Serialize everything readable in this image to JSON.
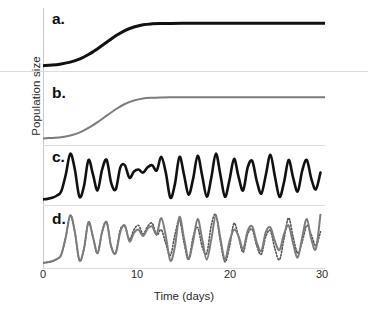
{
  "figure": {
    "axis_labels": {
      "y": "Population size",
      "x": "Time (days)"
    },
    "panel_labels": {
      "a": "a.",
      "b": "b.",
      "c": "c.",
      "d": "d."
    },
    "xticks": [
      "0",
      "10",
      "20",
      "30"
    ],
    "colors": {
      "black_curve": "#111111",
      "gray_curve": "#7c7c7c",
      "dotted_curve": "#555555",
      "axis": "#c9c9c9",
      "separator": "#dcdcdc",
      "background": "#ffffff"
    }
  },
  "chart_data": [
    {
      "type": "line",
      "panel": "a.",
      "title": "",
      "xlabel": "Time (days)",
      "ylabel": "Population size",
      "xlim": [
        0,
        31
      ],
      "ylim": [
        0,
        1
      ],
      "grid": false,
      "legend": "none",
      "series": [
        {
          "name": "stable equilibrium (thick black)",
          "style": "solid",
          "color": "#111111",
          "linewidth": 3,
          "x": [
            0,
            1,
            2,
            3,
            4,
            5,
            6,
            7,
            8,
            9,
            10,
            11,
            12,
            13,
            14,
            16,
            18,
            20,
            22,
            24,
            26,
            28,
            30,
            31
          ],
          "values": [
            0.04,
            0.05,
            0.07,
            0.1,
            0.15,
            0.23,
            0.33,
            0.44,
            0.55,
            0.64,
            0.7,
            0.74,
            0.755,
            0.76,
            0.762,
            0.763,
            0.763,
            0.763,
            0.763,
            0.763,
            0.763,
            0.763,
            0.763,
            0.763
          ]
        }
      ]
    },
    {
      "type": "line",
      "panel": "b.",
      "title": "",
      "xlabel": "Time (days)",
      "ylabel": "Population size",
      "xlim": [
        0,
        31
      ],
      "ylim": [
        0,
        1
      ],
      "grid": false,
      "legend": "none",
      "series": [
        {
          "name": "stable equilibrium (gray)",
          "style": "solid",
          "color": "#7c7c7c",
          "linewidth": 2,
          "x": [
            0,
            1,
            2,
            3,
            4,
            5,
            6,
            7,
            8,
            9,
            10,
            11,
            12,
            13,
            14,
            16,
            18,
            20,
            22,
            24,
            26,
            28,
            30,
            31
          ],
          "values": [
            0.06,
            0.07,
            0.08,
            0.11,
            0.16,
            0.24,
            0.34,
            0.45,
            0.56,
            0.65,
            0.71,
            0.745,
            0.757,
            0.762,
            0.764,
            0.765,
            0.765,
            0.765,
            0.765,
            0.765,
            0.765,
            0.765,
            0.765,
            0.765
          ]
        }
      ]
    },
    {
      "type": "line",
      "panel": "c.",
      "title": "",
      "xlabel": "Time (days)",
      "ylabel": "Population size",
      "xlim": [
        0,
        31
      ],
      "ylim": [
        0,
        1
      ],
      "grid": false,
      "legend": "none",
      "series": [
        {
          "name": "chaotic oscillation (thick black)",
          "style": "solid",
          "color": "#111111",
          "linewidth": 2.6,
          "x": [
            0,
            0.5,
            1,
            1.5,
            2,
            2.5,
            3,
            3.5,
            4,
            4.5,
            5,
            5.5,
            6,
            6.5,
            7,
            7.5,
            8,
            8.5,
            9,
            9.5,
            10,
            10.5,
            11,
            11.5,
            12,
            12.5,
            13,
            13.5,
            14,
            14.5,
            15,
            15.5,
            16,
            16.5,
            17,
            17.5,
            18,
            18.5,
            19,
            19.5,
            20,
            20.5,
            21,
            21.5,
            22,
            22.5,
            23,
            23.5,
            24,
            24.5,
            25,
            25.5,
            26,
            26.5,
            27,
            27.5,
            28,
            28.5,
            29,
            29.5,
            30,
            30.5
          ],
          "values": [
            0.05,
            0.06,
            0.08,
            0.12,
            0.2,
            0.52,
            0.92,
            0.62,
            0.1,
            0.3,
            0.8,
            0.52,
            0.22,
            0.62,
            0.8,
            0.36,
            0.24,
            0.66,
            0.7,
            0.46,
            0.58,
            0.62,
            0.56,
            0.66,
            0.7,
            0.6,
            0.86,
            0.56,
            0.08,
            0.34,
            0.86,
            0.52,
            0.14,
            0.44,
            0.88,
            0.5,
            0.1,
            0.46,
            0.92,
            0.52,
            0.1,
            0.42,
            0.82,
            0.48,
            0.22,
            0.66,
            0.78,
            0.4,
            0.16,
            0.52,
            0.9,
            0.48,
            0.1,
            0.38,
            0.8,
            0.46,
            0.2,
            0.6,
            0.8,
            0.44,
            0.24,
            0.56
          ]
        }
      ]
    },
    {
      "type": "line",
      "panel": "d.",
      "title": "",
      "xlabel": "Time (days)",
      "ylabel": "Population size",
      "xlim": [
        0,
        31
      ],
      "ylim": [
        0,
        1
      ],
      "grid": false,
      "legend": "none",
      "series": [
        {
          "name": "trajectory 1 (gray solid)",
          "style": "solid",
          "color": "#7c7c7c",
          "linewidth": 2,
          "x": [
            0,
            0.5,
            1,
            1.5,
            2,
            2.5,
            3,
            3.5,
            4,
            4.5,
            5,
            5.5,
            6,
            6.5,
            7,
            7.5,
            8,
            8.5,
            9,
            9.5,
            10,
            10.5,
            11,
            11.5,
            12,
            12.5,
            13,
            13.5,
            14,
            14.5,
            15,
            15.5,
            16,
            16.5,
            17,
            17.5,
            18,
            18.5,
            19,
            19.5,
            20,
            20.5,
            21,
            21.5,
            22,
            22.5,
            23,
            23.5,
            24,
            24.5,
            25,
            25.5,
            26,
            26.5,
            27,
            27.5,
            28,
            28.5,
            29,
            29.5,
            30,
            30.5
          ],
          "values": [
            0.04,
            0.05,
            0.07,
            0.11,
            0.19,
            0.52,
            0.93,
            0.62,
            0.09,
            0.3,
            0.8,
            0.52,
            0.22,
            0.62,
            0.8,
            0.34,
            0.22,
            0.62,
            0.74,
            0.44,
            0.6,
            0.66,
            0.54,
            0.68,
            0.72,
            0.58,
            0.88,
            0.54,
            0.08,
            0.34,
            0.9,
            0.5,
            0.12,
            0.44,
            0.86,
            0.48,
            0.1,
            0.48,
            0.92,
            0.5,
            0.1,
            0.44,
            0.66,
            0.54,
            0.3,
            0.64,
            0.72,
            0.42,
            0.26,
            0.62,
            0.7,
            0.44,
            0.28,
            0.58,
            0.74,
            0.4,
            0.14,
            0.52,
            0.86,
            0.48,
            0.3,
            0.94
          ]
        },
        {
          "name": "trajectory 2 (dotted)",
          "style": "dotted",
          "color": "#555555",
          "linewidth": 1.6,
          "x": [
            0,
            0.5,
            1,
            1.5,
            2,
            2.5,
            3,
            3.5,
            4,
            4.5,
            5,
            5.5,
            6,
            6.5,
            7,
            7.5,
            8,
            8.5,
            9,
            9.5,
            10,
            10.5,
            11,
            11.5,
            12,
            12.5,
            13,
            13.5,
            14,
            14.5,
            15,
            15.5,
            16,
            16.5,
            17,
            17.5,
            18,
            18.5,
            19,
            19.5,
            20,
            20.5,
            21,
            21.5,
            22,
            22.5,
            23,
            23.5,
            24,
            24.5,
            25,
            25.5,
            26,
            26.5,
            27,
            27.5,
            28,
            28.5,
            29,
            29.5,
            30,
            30.5
          ],
          "values": [
            0.04,
            0.05,
            0.07,
            0.11,
            0.19,
            0.52,
            0.93,
            0.62,
            0.09,
            0.3,
            0.8,
            0.52,
            0.22,
            0.62,
            0.8,
            0.34,
            0.24,
            0.66,
            0.72,
            0.48,
            0.66,
            0.74,
            0.58,
            0.72,
            0.78,
            0.56,
            0.66,
            0.4,
            0.18,
            0.56,
            0.84,
            0.42,
            0.1,
            0.52,
            0.7,
            0.34,
            0.22,
            0.74,
            0.94,
            0.44,
            0.06,
            0.34,
            0.78,
            0.52,
            0.24,
            0.58,
            0.66,
            0.36,
            0.2,
            0.54,
            0.64,
            0.3,
            0.1,
            0.5,
            0.88,
            0.52,
            0.22,
            0.44,
            0.74,
            0.56,
            0.36,
            0.62
          ]
        }
      ]
    }
  ]
}
